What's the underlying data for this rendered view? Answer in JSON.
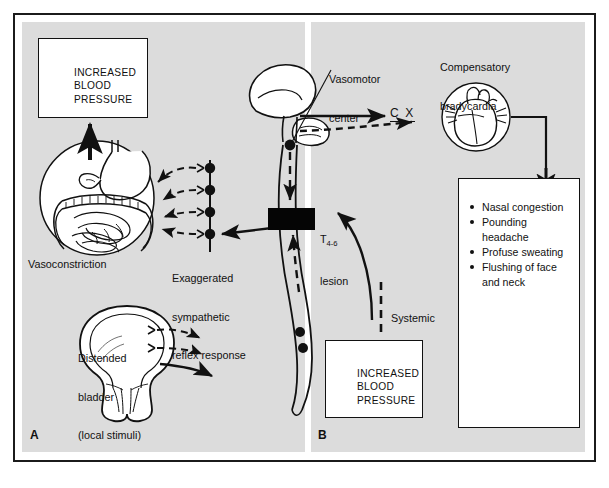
{
  "figure": {
    "background_color": "#dcdcdc",
    "frame_color": "#1b1b1b",
    "ink_color": "#111111"
  },
  "panels": [
    {
      "id": "A",
      "letter": "A",
      "name": "panel-a-spinal-reflex"
    },
    {
      "id": "B",
      "letter": "B",
      "name": "panel-b-systemic-response"
    }
  ],
  "panel_a": {
    "bp_box": {
      "line1": "INCREASED",
      "line2": "BLOOD",
      "line3": "PRESSURE"
    },
    "vasoconstriction_label": "Vasoconstriction",
    "reflex_label": {
      "line1": "Exaggerated",
      "line2": "sympathetic",
      "line3": "reflex response"
    },
    "bladder_label": {
      "line1": "Distended",
      "line2": "bladder",
      "line3": "(local stimuli)"
    },
    "ganglia_count": 4
  },
  "panel_b": {
    "vasomotor_label": {
      "line1": "Vasomotor",
      "line2": "center"
    },
    "bradycardia_label": {
      "line1": "Compensatory",
      "line2": "bradycardia"
    },
    "cranial_nerve_label": "C X",
    "lesion_label": {
      "level": "T",
      "segments": "4-6",
      "word": "lesion"
    },
    "systemic_route_label": {
      "line1": "Systemic",
      "line2": "route"
    },
    "bp_box": {
      "line1": "INCREASED",
      "line2": "BLOOD",
      "line3": "PRESSURE"
    },
    "symptoms": [
      "Nasal congestion",
      "Pounding headache",
      "Profuse sweating",
      "Flushing of face"
    ],
    "symptoms_continuation": "and neck"
  }
}
